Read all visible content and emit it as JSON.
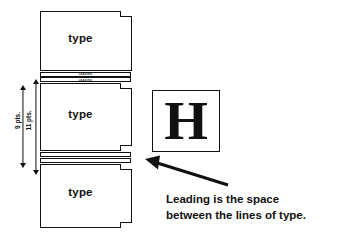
{
  "diagram": {
    "ink_color": "#111111",
    "background_color": "#ffffff"
  },
  "slugs": [
    {
      "name": "top-slug",
      "label": "type"
    },
    {
      "name": "middle-slug",
      "label": "type"
    },
    {
      "name": "bottom-slug",
      "label": "type"
    }
  ],
  "leading_strips": [
    {
      "name": "leading-strip-upper-1",
      "text": "LEADING"
    },
    {
      "name": "leading-strip-upper-2",
      "text": "LEADING"
    },
    {
      "name": "leading-strip-lower-1",
      "text": ""
    },
    {
      "name": "leading-strip-lower-2",
      "text": ""
    }
  ],
  "dimensions": [
    {
      "name": "type-size-dimension",
      "label": "9 pts."
    },
    {
      "name": "leading-size-dimension",
      "label": "11 pts."
    }
  ],
  "specimen": {
    "glyph": "H",
    "box_name": "letter-specimen-box"
  },
  "caption": {
    "line1": "Leading is the space",
    "line2": "between the lines of type."
  },
  "annotation": {
    "arrow_name": "caption-pointer-arrow",
    "points_to": "leading-strip-lower-1"
  }
}
